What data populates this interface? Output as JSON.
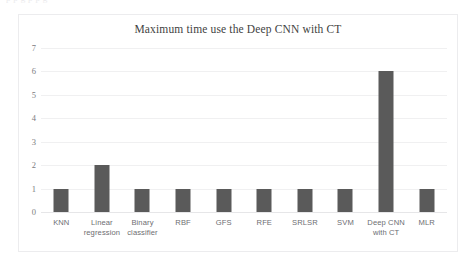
{
  "artifact": {
    "top_text": "p p g p p g"
  },
  "chart_data": {
    "type": "bar",
    "title": "Maximum time use the Deep CNN with CT",
    "xlabel": "",
    "ylabel": "",
    "ylim": [
      0,
      7
    ],
    "yticks": [
      7,
      6,
      5,
      4,
      3,
      2,
      1,
      0
    ],
    "grid": true,
    "legend": false,
    "bar_color": "#5a5a5a",
    "categories": [
      "KNN",
      "Linear regression",
      "Binary classifier",
      "RBF",
      "GFS",
      "RFE",
      "SRLSR",
      "SVM",
      "Deep CNN with CT",
      "MLR"
    ],
    "values": [
      1,
      2,
      1,
      1,
      1,
      1,
      1,
      1,
      6,
      1
    ]
  }
}
